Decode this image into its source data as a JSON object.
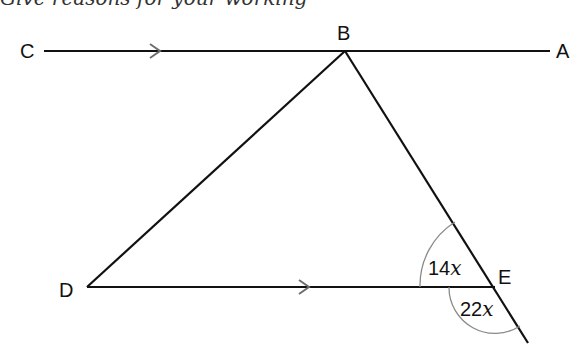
{
  "caption": "Give reasons for your working",
  "diagram": {
    "points": {
      "A": {
        "label": "A"
      },
      "B": {
        "label": "B"
      },
      "C": {
        "label": "C"
      },
      "D": {
        "label": "D"
      },
      "E": {
        "label": "E"
      }
    },
    "angles": {
      "inner_E": {
        "coef": "14",
        "var": "x"
      },
      "outer_E": {
        "coef": "22",
        "var": "x"
      }
    },
    "parallel_marks": [
      "CA",
      "DE"
    ],
    "colors": {
      "line": "#111111",
      "arc": "#8a8a8a",
      "arrow": "#6e6e6e"
    }
  }
}
